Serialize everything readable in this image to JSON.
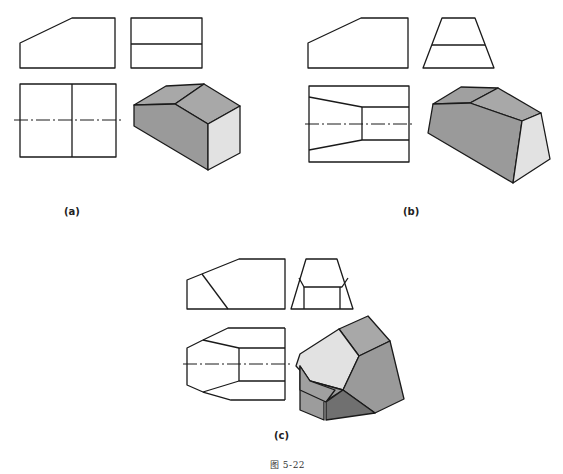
{
  "figure": {
    "title": "图 5-22",
    "panels": [
      {
        "id": "a",
        "label": "(a)",
        "views": [
          "front-view",
          "side-view",
          "top-view",
          "isometric"
        ]
      },
      {
        "id": "b",
        "label": "(b)",
        "views": [
          "front-view",
          "side-view",
          "top-view",
          "isometric"
        ]
      },
      {
        "id": "c",
        "label": "(c)",
        "views": [
          "front-view",
          "side-view",
          "top-view",
          "isometric"
        ]
      }
    ]
  },
  "colors": {
    "line": "#1a1a1a",
    "shade_dark": "#8c8c8c",
    "shade_mid": "#a8a8a8",
    "shade_light": "#e2e2e2",
    "shade_darkest": "#707070"
  }
}
